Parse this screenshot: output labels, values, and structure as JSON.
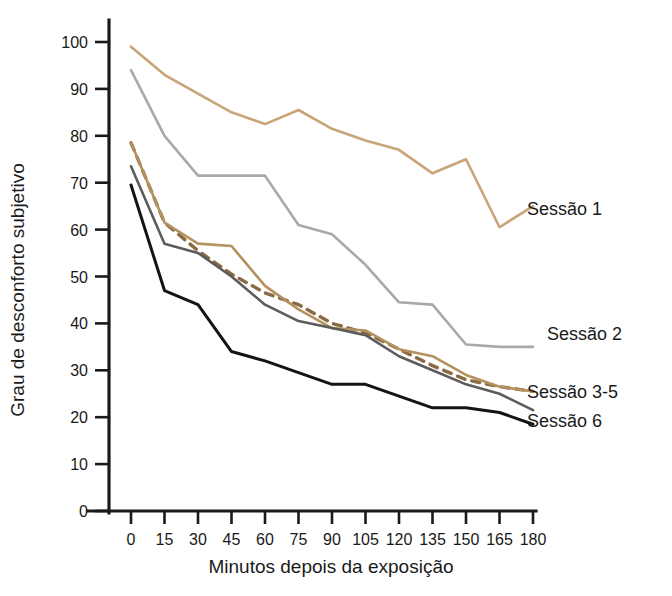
{
  "chart_data": {
    "type": "line",
    "title": "",
    "subtitle": "",
    "xlabel": "Minutos depois da exposição",
    "ylabel": "Grau de desconforto subjetivo",
    "x": [
      0,
      15,
      30,
      45,
      60,
      75,
      90,
      105,
      120,
      135,
      150,
      165,
      180
    ],
    "xtick_labels": [
      "0",
      "15",
      "30",
      "45",
      "60",
      "75",
      "90",
      "105",
      "120",
      "135",
      "150",
      "165",
      "180"
    ],
    "ytick_labels": [
      "0",
      "10",
      "20",
      "30",
      "40",
      "50",
      "60",
      "70",
      "80",
      "90",
      "100"
    ],
    "yticks": [
      0,
      10,
      20,
      30,
      40,
      50,
      60,
      70,
      80,
      90,
      100
    ],
    "xlim": [
      0,
      180
    ],
    "ylim": [
      0,
      105
    ],
    "grid": false,
    "legend_position": "right-inline",
    "series": [
      {
        "name": "Sessão 1",
        "color": "#c9a478",
        "style": "solid",
        "width": 2.6,
        "values": [
          99,
          93,
          89,
          85,
          82.5,
          85.5,
          81.5,
          79,
          77,
          72,
          75,
          60.5,
          65
        ]
      },
      {
        "name": "Sessão 2",
        "color": "#a9a9a9",
        "style": "solid",
        "width": 2.6,
        "values": [
          94,
          80,
          71.5,
          71.5,
          71.5,
          61,
          59,
          52.5,
          44.5,
          44,
          35.5,
          35,
          35
        ]
      },
      {
        "name": "Sessão 3-5",
        "color": "#8a6a42",
        "style": "dashed",
        "width": 3.4,
        "values": [
          78.5,
          61.5,
          55.5,
          50.5,
          46.5,
          44,
          40,
          38,
          34.5,
          31,
          28,
          26.5,
          25.5
        ]
      },
      {
        "name": "Sessão 3-5 (sólida)",
        "color": "#b4915f",
        "style": "solid",
        "width": 2.6,
        "values": [
          78.5,
          61.5,
          57,
          56.5,
          48,
          43,
          39,
          38.5,
          34.5,
          33,
          29,
          26.5,
          25.5
        ]
      },
      {
        "name": "Sessão 3-5 (cinza)",
        "color": "#5c5c5c",
        "style": "solid",
        "width": 2.6,
        "values": [
          73.5,
          57,
          55,
          50,
          44,
          40.5,
          39,
          37.5,
          33,
          30,
          27,
          25,
          21.5
        ]
      },
      {
        "name": "Sessão 6",
        "color": "#141414",
        "style": "solid",
        "width": 3.0,
        "values": [
          69.5,
          47,
          44,
          34,
          32,
          29.5,
          27,
          27,
          24.5,
          22,
          22,
          21,
          18.5
        ]
      }
    ],
    "annotations": [
      {
        "text": "Sessão 1",
        "x_px": 527,
        "y_px": 215
      },
      {
        "text": "Sessão 2",
        "x_px": 547,
        "y_px": 340
      },
      {
        "text": "Sessão 3-5",
        "x_px": 527,
        "y_px": 398
      },
      {
        "text": "Sessão 6",
        "x_px": 527,
        "y_px": 427
      }
    ]
  },
  "labels": {
    "xlabel": "Minutos depois da exposição",
    "ylabel": "Grau de desconforto subjetivo",
    "legend": {
      "s1": "Sessão 1",
      "s2": "Sessão 2",
      "s35": "Sessão 3-5",
      "s6": "Sessão 6"
    }
  }
}
